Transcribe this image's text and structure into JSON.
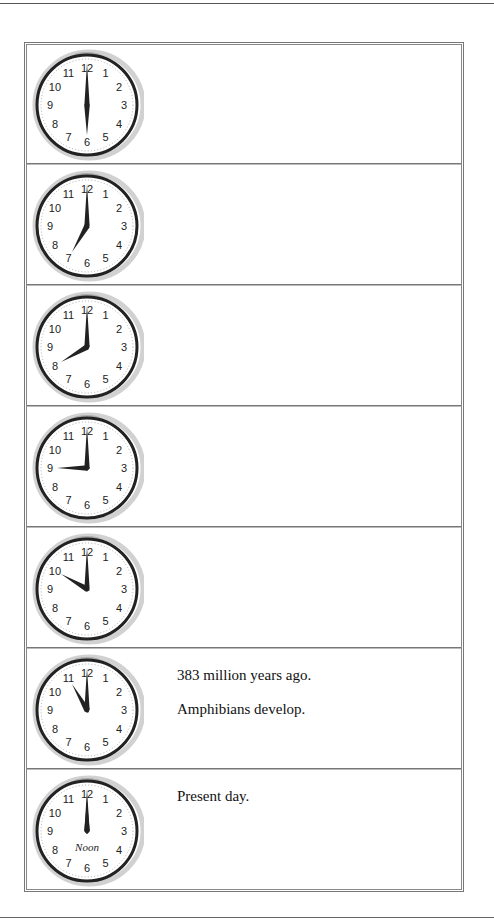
{
  "timeline": {
    "rows": [
      {
        "clock_time": "6:00",
        "hour": 6,
        "minute": 0,
        "captions": []
      },
      {
        "clock_time": "7:00",
        "hour": 7,
        "minute": 0,
        "captions": []
      },
      {
        "clock_time": "8:00",
        "hour": 8,
        "minute": 0,
        "captions": []
      },
      {
        "clock_time": "9:00",
        "hour": 9,
        "minute": 0,
        "captions": []
      },
      {
        "clock_time": "10:00",
        "hour": 10,
        "minute": 0,
        "captions": []
      },
      {
        "clock_time": "11:00",
        "hour": 11,
        "minute": 0,
        "captions": [
          "383 million years ago.",
          "Amphibians develop."
        ]
      },
      {
        "clock_time": "12:00",
        "hour": 12,
        "minute": 0,
        "clock_label": "Noon",
        "captions": [
          "Present day."
        ]
      }
    ]
  },
  "clock_face": {
    "numerals": [
      "12",
      "1",
      "2",
      "3",
      "4",
      "5",
      "6",
      "7",
      "8",
      "9",
      "10",
      "11"
    ]
  }
}
